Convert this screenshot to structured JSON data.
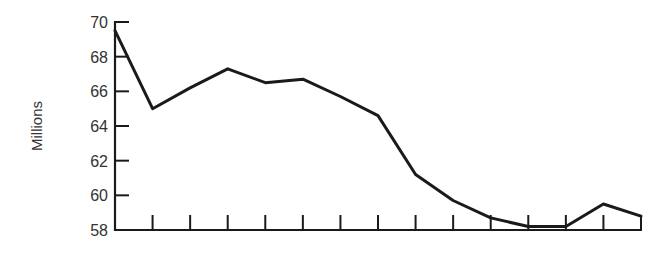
{
  "chart_data": {
    "type": "line",
    "title": "",
    "xlabel": "",
    "ylabel": "Millions",
    "ylim": [
      58,
      70
    ],
    "yticks": [
      58,
      60,
      62,
      64,
      66,
      68,
      70
    ],
    "ytick_labels": [
      "58",
      "60",
      "62",
      "64",
      "66",
      "68",
      "70"
    ],
    "x": [
      0,
      1,
      2,
      3,
      4,
      5,
      6,
      7,
      8,
      9,
      10,
      11,
      12,
      13,
      14
    ],
    "xtick_labels": [],
    "grid": false,
    "legend": null,
    "series": [
      {
        "name": "Millions",
        "color": "#1a1a1a",
        "values": [
          69.5,
          65.0,
          66.2,
          67.3,
          66.5,
          66.7,
          65.7,
          64.6,
          61.2,
          59.7,
          58.7,
          58.2,
          58.2,
          59.5,
          58.8
        ]
      }
    ]
  },
  "axis": {
    "y_title": "Millions",
    "y_tick_labels": [
      "70",
      "68",
      "66",
      "64",
      "62",
      "60",
      "58"
    ]
  }
}
